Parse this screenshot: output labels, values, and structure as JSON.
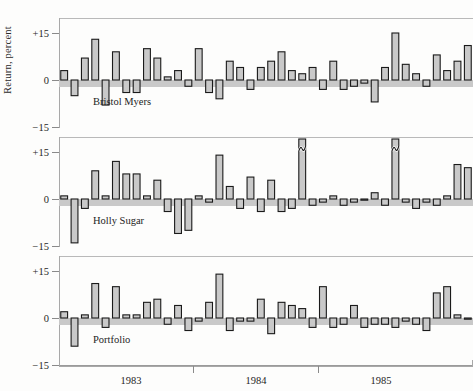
{
  "chart_data": {
    "type": "bar",
    "title": "",
    "subtitle": "",
    "xlabel": "",
    "ylabel": "Return, percent",
    "grid": false,
    "legend_position": "none",
    "panel_layout": "vertical-small-multiples",
    "ylim": [
      -22,
      22
    ],
    "ytick_values": [
      15,
      0,
      -15
    ],
    "ytick_labels": [
      "+15",
      "0",
      "−15"
    ],
    "xtick_labels": [
      "1983",
      "1984",
      "1985"
    ],
    "x_axis_note": "monthly observations spanning 1983 through early 1986; year labels centered within each year",
    "n_points": 40,
    "zero_reference_band": true,
    "broken_bar_marker": "squiggle indicates bar clipped at panel top",
    "panels": [
      {
        "name": "Bristol Myers",
        "label": "Bristol Myers",
        "values": [
          3,
          -5,
          7,
          13,
          -8,
          9,
          -4,
          -4,
          10,
          7,
          1,
          3,
          -2,
          10,
          -4,
          -6,
          6,
          4,
          -3,
          4,
          6,
          9,
          3,
          2,
          4,
          -3,
          6,
          -3,
          -2,
          -1,
          -7,
          4,
          15,
          5,
          2,
          -2,
          8,
          3,
          6,
          11
        ],
        "clipped_indices": []
      },
      {
        "name": "Holly Sugar",
        "label": "Holly Sugar",
        "values": [
          1,
          -14,
          -3,
          9,
          1,
          12,
          8,
          8,
          1,
          6,
          -4,
          -11,
          -10,
          1,
          -1,
          14,
          4,
          -3,
          7,
          -4,
          6,
          -4,
          -3,
          22,
          -2,
          -1,
          1,
          -2,
          -1,
          0,
          2,
          -2,
          22,
          -1,
          -3,
          -1,
          -2,
          1,
          11,
          10
        ],
        "clipped_indices": [
          15,
          23,
          32
        ],
        "clipped_note": "two tall bars are clipped at the +15 frame edge and drawn with a broken-axis squiggle"
      },
      {
        "name": "Portfolio",
        "label": "Portfolio",
        "values": [
          2,
          -9,
          1,
          11,
          -3,
          10,
          1,
          1,
          5,
          6,
          -2,
          4,
          -4,
          -1,
          5,
          14,
          -4,
          -1,
          -1,
          6,
          -5,
          5,
          4,
          3,
          -3,
          10,
          -3,
          -2,
          4,
          -3,
          -2,
          -2,
          -3,
          -1,
          -2,
          -4,
          8,
          10,
          1,
          0
        ],
        "clipped_indices": []
      }
    ]
  },
  "figure": {
    "ylabel": "Return, percent",
    "ytick_top": "+15",
    "ytick_mid": "0",
    "ytick_bot": "−15",
    "year_1": "1983",
    "year_2": "1984",
    "year_3": "1985",
    "panel_1_label": "Bristol Myers",
    "panel_2_label": "Holly Sugar",
    "panel_3_label": "Portfolio",
    "colors": {
      "bar_fill": "#c9c9c9",
      "bar_stroke": "#1a1a1a",
      "frame": "#b9b9b9",
      "axis": "#a8a8a8",
      "text": "#1f1f1f",
      "background": "#fdfdfc"
    }
  }
}
